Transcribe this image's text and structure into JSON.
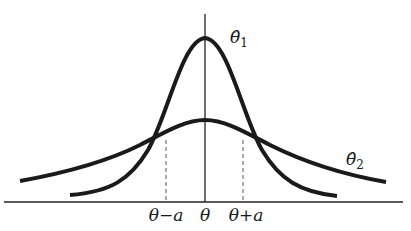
{
  "diagram": {
    "type": "two-estimator-sampling-distributions",
    "curves": [
      {
        "id": "theta1",
        "label": "θ̂",
        "subscript": "1",
        "description": "narrow tall density centered at θ"
      },
      {
        "id": "theta2",
        "label": "θ̂",
        "subscript": "2",
        "description": "wide flat density centered at θ"
      }
    ],
    "axis_labels": {
      "left": "θ−a",
      "center": "θ",
      "right": "θ+a"
    },
    "colors": {
      "curve": "#1a1a1a",
      "axis": "#222222",
      "dashed": "#555555"
    }
  }
}
